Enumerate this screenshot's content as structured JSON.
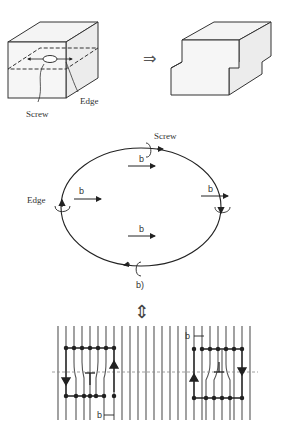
{
  "panel_a": {
    "labels": {
      "screw": "Screw",
      "edge": "Edge"
    },
    "arrow": "⇒"
  },
  "panel_b": {
    "labels": {
      "screw": "Screw",
      "edge": "Edge",
      "b": "b",
      "caption": "b)"
    },
    "burgers_vectors": [
      "b",
      "b",
      "b",
      "b"
    ]
  },
  "equivalence_arrow": "⇕",
  "panel_c": {
    "labels": {
      "b_left": "b",
      "b_right": "b"
    },
    "symbol": "⊥"
  }
}
